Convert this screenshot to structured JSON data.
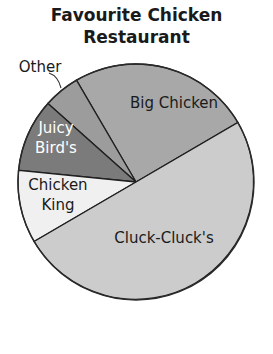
{
  "chart_data": {
    "type": "pie",
    "title": "Favourite Chicken Restaurant",
    "title_lines": [
      "Favourite Chicken",
      "Restaurant"
    ],
    "unit": "percent",
    "start_angle_deg": 30.3,
    "direction": "counterclockwise",
    "slices": [
      {
        "label": "Big Chicken",
        "value": 25,
        "color": "#a8a8a8",
        "text_color": "#1a1a1a",
        "label_lines": [
          "Big Chicken"
        ],
        "label_x": 174,
        "label_y": 103
      },
      {
        "label": "Other",
        "value": 5,
        "color": "#9c9c9c",
        "text_color": "#1a1a1a",
        "label_lines": [
          "Other"
        ],
        "external": true,
        "label_x": 40,
        "label_y": 67
      },
      {
        "label": "Juicy Bird's",
        "value": 10,
        "color": "#7b7b7b",
        "text_color": "#ffffff",
        "label_lines": [
          "Juicy",
          "Bird's"
        ],
        "label_x": 56,
        "label_y": 138
      },
      {
        "label": "Chicken King",
        "value": 10,
        "color": "#f0f0f0",
        "text_color": "#1a1a1a",
        "label_lines": [
          "Chicken",
          "King"
        ],
        "label_x": 58,
        "label_y": 195
      },
      {
        "label": "Cluck-Cluck's",
        "value": 50,
        "color": "#cccccc",
        "text_color": "#1a1a1a",
        "label_lines": [
          "Cluck-Cluck's"
        ],
        "label_x": 164,
        "label_y": 238
      }
    ],
    "legend": "none",
    "grid": false
  },
  "pie_geometry": {
    "cx": 136,
    "cy": 182,
    "r": 118
  }
}
